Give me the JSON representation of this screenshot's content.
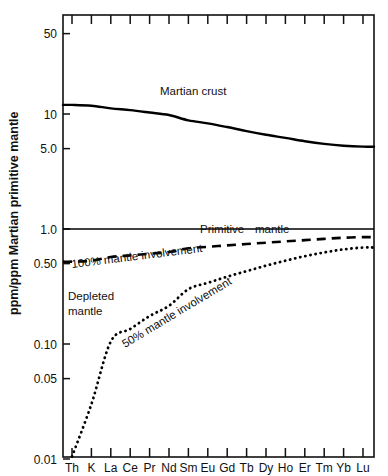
{
  "chart_data": {
    "type": "line",
    "title": "",
    "xlabel": "",
    "ylabel": "ppm/ppm Martian primitive mantle",
    "yscale": "log",
    "ylim": [
      0.01,
      100
    ],
    "ytick_labels": [
      "50",
      "10",
      "5.0",
      "1.0",
      "0.50",
      "0.10",
      "0.05",
      "0.01"
    ],
    "ytick_values": [
      50,
      10,
      5.0,
      1.0,
      0.5,
      0.1,
      0.05,
      0.01
    ],
    "categories": [
      "Th",
      "K",
      "La",
      "Ce",
      "Pr",
      "Nd",
      "Sm",
      "Eu",
      "Gd",
      "Tb",
      "Dy",
      "Ho",
      "Er",
      "Tm",
      "Yb",
      "Lu"
    ],
    "grid": false,
    "legend_position": "inline-annotations",
    "series": [
      {
        "name": "Martian crust",
        "style": "solid",
        "values": [
          12.0,
          11.8,
          11.2,
          10.8,
          10.3,
          9.8,
          8.8,
          8.3,
          7.7,
          7.1,
          6.6,
          6.2,
          5.8,
          5.5,
          5.3,
          5.2
        ]
      },
      {
        "name": "100% mantle involvement",
        "style": "dashed",
        "values": [
          0.52,
          0.53,
          0.57,
          0.59,
          0.61,
          0.63,
          0.68,
          0.7,
          0.72,
          0.74,
          0.76,
          0.78,
          0.8,
          0.82,
          0.84,
          0.85
        ]
      },
      {
        "name": "50% mantle involvement",
        "style": "dotted",
        "values": [
          0.0105,
          0.03,
          0.105,
          0.135,
          0.175,
          0.215,
          0.3,
          0.34,
          0.385,
          0.43,
          0.48,
          0.53,
          0.58,
          0.625,
          0.665,
          0.69
        ]
      },
      {
        "name": "Primitive mantle",
        "style": "thin-solid",
        "values": [
          1.0,
          1.0,
          1.0,
          1.0,
          1.0,
          1.0,
          1.0,
          1.0,
          1.0,
          1.0,
          1.0,
          1.0,
          1.0,
          1.0,
          1.0,
          1.0
        ]
      }
    ],
    "annotations": [
      {
        "text": "Martian crust",
        "x": 160,
        "y": 95,
        "rotation": 0
      },
      {
        "text": "Primitive",
        "x": 200,
        "y": 233,
        "rotation": 0
      },
      {
        "text": "mantle",
        "x": 255,
        "y": 233,
        "rotation": 0
      },
      {
        "text": "100% mantle involvement",
        "x": 72,
        "y": 268,
        "rotation": -7
      },
      {
        "text": "50% mantle involvement",
        "x": 125,
        "y": 348,
        "rotation": -31
      },
      {
        "text": "Depleted",
        "x": 68,
        "y": 300,
        "rotation": 0
      },
      {
        "text": "mantle",
        "x": 68,
        "y": 315,
        "rotation": 0
      }
    ]
  },
  "colors": {
    "ink": "#111111",
    "background": "#ffffff"
  }
}
